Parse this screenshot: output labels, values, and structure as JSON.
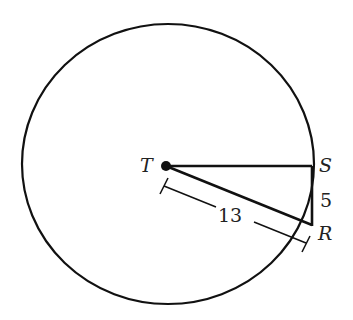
{
  "figure": {
    "type": "geometry",
    "points": {
      "T": {
        "label": "T",
        "role": "center of circle"
      },
      "S": {
        "label": "S",
        "role": "point of tangency on circle"
      },
      "R": {
        "label": "R",
        "role": "point outside circle"
      }
    },
    "segments": [
      {
        "name": "TS",
        "from": "T",
        "to": "S",
        "label": ""
      },
      {
        "name": "SR",
        "from": "S",
        "to": "R",
        "label": "5"
      },
      {
        "name": "TR",
        "from": "T",
        "to": "R",
        "label": "13"
      }
    ],
    "labels": {
      "T": "T",
      "S": "S",
      "R": "R",
      "SR_length": "5",
      "TR_length": "13"
    },
    "colors": {
      "stroke": "#111111",
      "text": "#222222",
      "background": "#ffffff"
    }
  }
}
